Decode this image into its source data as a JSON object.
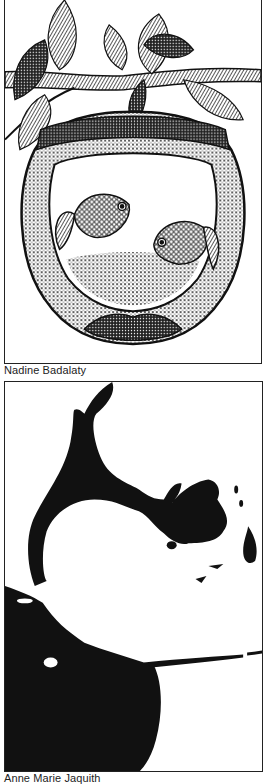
{
  "page": {
    "background": "#ffffff",
    "ink_color": "#111111"
  },
  "artworks": [
    {
      "subject": "fishbowl-with-leaves-and-two-fish",
      "style": "stippled pen-and-ink illustration",
      "caption": "Nadine Badalaty"
    },
    {
      "subject": "abstract-black-and-white-shapes",
      "style": "high-contrast black ink silhouette",
      "caption": "Anne Marie Jaquith"
    }
  ]
}
